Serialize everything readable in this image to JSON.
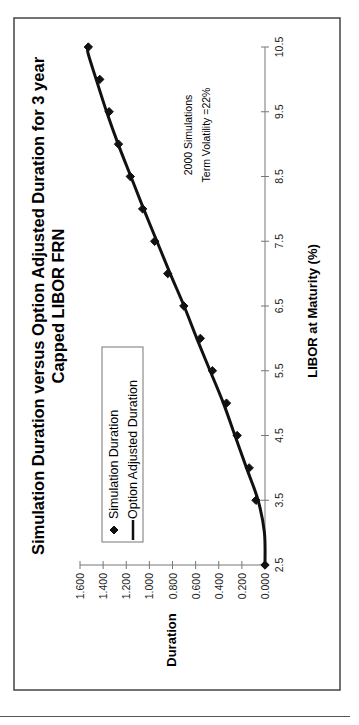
{
  "chart_data": {
    "type": "scatter",
    "title": "Simulation Duration versus Option Adjusted Duration for 3 year Capped LIBOR FRN",
    "title_lines": [
      "Simulation Duration versus Option Adjusted Duration for 3 year",
      "Capped LIBOR FRN"
    ],
    "xlabel": "LIBOR at Maturity (%)",
    "ylabel": "Duration",
    "xlim": [
      2.5,
      10.5
    ],
    "ylim": [
      0.0,
      1.6
    ],
    "x_ticks": [
      "2.5",
      "3.5",
      "4.5",
      "5.5",
      "6.5",
      "7.5",
      "8.5",
      "9.5",
      "10.5"
    ],
    "y_ticks": [
      "0.000",
      "0.200",
      "0.400",
      "0.600",
      "0.800",
      "1.000",
      "1.200",
      "1.400",
      "1.600"
    ],
    "grid": false,
    "legend_position": "inside-upper-left",
    "orientation": "rotated -90deg on page",
    "series": [
      {
        "name": "Simulation Duration",
        "kind": "markers",
        "marker": "diamond",
        "x": [
          2.5,
          3.5,
          4.0,
          4.5,
          5.0,
          5.5,
          6.0,
          6.5,
          7.0,
          7.5,
          8.0,
          8.5,
          9.0,
          9.5,
          10.0,
          10.5
        ],
        "values": [
          0.0,
          0.078,
          0.137,
          0.241,
          0.333,
          0.455,
          0.559,
          0.702,
          0.841,
          0.954,
          1.058,
          1.165,
          1.267,
          1.348,
          1.429,
          1.528
        ]
      },
      {
        "name": "Option Adjusted Duration",
        "kind": "line",
        "x": [
          2.5,
          3.0,
          3.5,
          4.0,
          4.5,
          5.0,
          5.5,
          6.0,
          6.5,
          7.0,
          7.5,
          8.0,
          8.5,
          9.0,
          9.5,
          10.0,
          10.4,
          10.5
        ],
        "values": [
          0.0,
          0.005,
          0.06,
          0.16,
          0.26,
          0.36,
          0.475,
          0.59,
          0.7,
          0.82,
          0.935,
          1.05,
          1.16,
          1.27,
          1.37,
          1.46,
          1.53,
          1.53
        ]
      }
    ],
    "annotations": [
      "2000 Simulations",
      "Term Volatility  =22%"
    ]
  },
  "legend": {
    "items": [
      {
        "label": "Simulation Duration",
        "symbol": "diamond"
      },
      {
        "label": "Option Adjusted Duration",
        "symbol": "line"
      }
    ]
  },
  "colors": {
    "series": "#111111",
    "frame": "#444444",
    "axis": "#777777",
    "background": "#ffffff"
  }
}
